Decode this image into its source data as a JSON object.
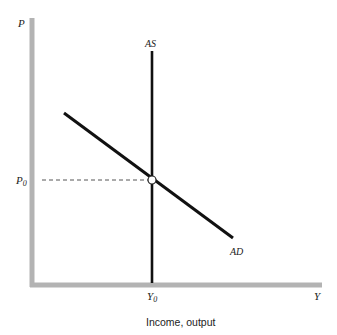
{
  "diagram": {
    "type": "AS-AD model",
    "labels": {
      "y_axis": "P",
      "x_axis": "Y",
      "aggregate_supply": "AS",
      "aggregate_demand": "AD",
      "equilibrium_price": "P",
      "equilibrium_price_sub": "0",
      "equilibrium_output": "Y",
      "equilibrium_output_sub": "0",
      "x_axis_caption": "Income, output"
    },
    "colors": {
      "axis": "#b3b3b3",
      "curve": "#111111",
      "dashed": "#555555",
      "point_fill": "#ffffff"
    },
    "geometry": {
      "origin": [
        32,
        285
      ],
      "y_axis_top": [
        32,
        18
      ],
      "x_axis_right": [
        322,
        285
      ],
      "as_line": [
        [
          152,
          51
        ],
        [
          152,
          285
        ]
      ],
      "ad_line": [
        [
          64,
          113
        ],
        [
          233,
          238
        ]
      ],
      "equilibrium": [
        152,
        180
      ]
    }
  }
}
